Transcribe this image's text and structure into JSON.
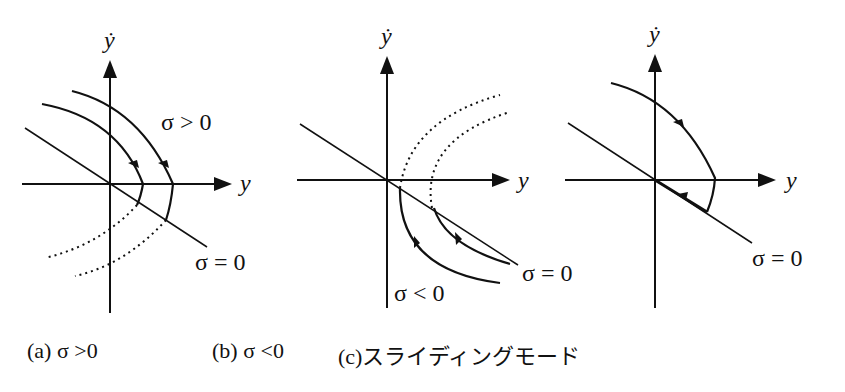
{
  "figure": {
    "axis_labels": {
      "x": "y",
      "y": "ẏ"
    },
    "panels": [
      {
        "id": "a",
        "region_label": "σ > 0",
        "line_label": "σ = 0",
        "caption": "(a)  σ >0"
      },
      {
        "id": "b",
        "region_label": "σ < 0",
        "line_label": "σ = 0",
        "caption": "(b)  σ <0"
      },
      {
        "id": "c",
        "line_label": "σ = 0",
        "caption": "(c)スライディングモード"
      }
    ]
  }
}
